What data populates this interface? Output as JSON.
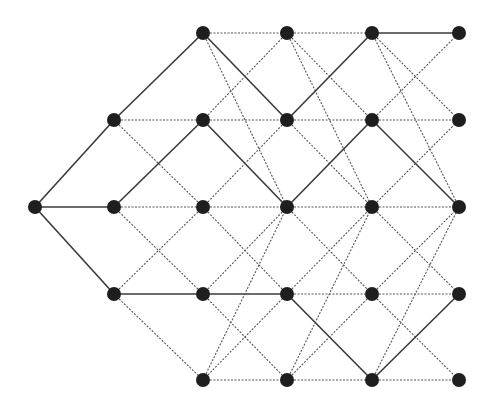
{
  "diagram": {
    "type": "layered-trellis-graph",
    "colors": {
      "background": "#ffffff",
      "node": "#1e1e1e",
      "solid_edge": "#3a3a3a",
      "dashed_edge": "#555555"
    },
    "node_radius": 7,
    "columns_x": [
      35,
      114,
      203,
      287,
      372,
      459
    ],
    "rows_y": [
      33,
      120,
      207,
      294,
      380
    ],
    "nodes": [
      {
        "id": "c0r2",
        "col": 0,
        "row": 2
      },
      {
        "id": "c1r1",
        "col": 1,
        "row": 1
      },
      {
        "id": "c1r2",
        "col": 1,
        "row": 2
      },
      {
        "id": "c1r3",
        "col": 1,
        "row": 3
      },
      {
        "id": "c2r0",
        "col": 2,
        "row": 0
      },
      {
        "id": "c2r1",
        "col": 2,
        "row": 1
      },
      {
        "id": "c2r2",
        "col": 2,
        "row": 2
      },
      {
        "id": "c2r3",
        "col": 2,
        "row": 3
      },
      {
        "id": "c2r4",
        "col": 2,
        "row": 4
      },
      {
        "id": "c3r0",
        "col": 3,
        "row": 0
      },
      {
        "id": "c3r1",
        "col": 3,
        "row": 1
      },
      {
        "id": "c3r2",
        "col": 3,
        "row": 2
      },
      {
        "id": "c3r3",
        "col": 3,
        "row": 3
      },
      {
        "id": "c3r4",
        "col": 3,
        "row": 4
      },
      {
        "id": "c4r0",
        "col": 4,
        "row": 0
      },
      {
        "id": "c4r1",
        "col": 4,
        "row": 1
      },
      {
        "id": "c4r2",
        "col": 4,
        "row": 2
      },
      {
        "id": "c4r3",
        "col": 4,
        "row": 3
      },
      {
        "id": "c4r4",
        "col": 4,
        "row": 4
      },
      {
        "id": "c5r0",
        "col": 5,
        "row": 0
      },
      {
        "id": "c5r1",
        "col": 5,
        "row": 1
      },
      {
        "id": "c5r2",
        "col": 5,
        "row": 2
      },
      {
        "id": "c5r3",
        "col": 5,
        "row": 3
      },
      {
        "id": "c5r4",
        "col": 5,
        "row": 4
      }
    ],
    "edges": [
      {
        "from": "c0r2",
        "to": "c1r1",
        "style": "solid"
      },
      {
        "from": "c0r2",
        "to": "c1r2",
        "style": "solid"
      },
      {
        "from": "c0r2",
        "to": "c1r3",
        "style": "solid"
      },
      {
        "from": "c1r1",
        "to": "c2r0",
        "style": "solid"
      },
      {
        "from": "c1r1",
        "to": "c2r1",
        "style": "dashed"
      },
      {
        "from": "c1r1",
        "to": "c2r2",
        "style": "dashed"
      },
      {
        "from": "c1r2",
        "to": "c2r1",
        "style": "solid"
      },
      {
        "from": "c1r2",
        "to": "c2r2",
        "style": "dashed"
      },
      {
        "from": "c1r2",
        "to": "c2r3",
        "style": "dashed"
      },
      {
        "from": "c1r3",
        "to": "c2r2",
        "style": "dashed"
      },
      {
        "from": "c1r3",
        "to": "c2r3",
        "style": "solid"
      },
      {
        "from": "c1r3",
        "to": "c2r4",
        "style": "dashed"
      },
      {
        "from": "c2r0",
        "to": "c3r0",
        "style": "dashed"
      },
      {
        "from": "c2r0",
        "to": "c3r1",
        "style": "solid"
      },
      {
        "from": "c2r0",
        "to": "c3r2",
        "style": "dashed"
      },
      {
        "from": "c2r1",
        "to": "c3r0",
        "style": "dashed"
      },
      {
        "from": "c2r1",
        "to": "c3r1",
        "style": "dashed"
      },
      {
        "from": "c2r1",
        "to": "c3r2",
        "style": "solid"
      },
      {
        "from": "c2r2",
        "to": "c3r1",
        "style": "dashed"
      },
      {
        "from": "c2r2",
        "to": "c3r2",
        "style": "dashed"
      },
      {
        "from": "c2r2",
        "to": "c3r3",
        "style": "dashed"
      },
      {
        "from": "c2r3",
        "to": "c3r2",
        "style": "dashed"
      },
      {
        "from": "c2r3",
        "to": "c3r3",
        "style": "solid"
      },
      {
        "from": "c2r3",
        "to": "c3r4",
        "style": "dashed"
      },
      {
        "from": "c2r4",
        "to": "c3r2",
        "style": "dashed"
      },
      {
        "from": "c2r4",
        "to": "c3r3",
        "style": "dashed"
      },
      {
        "from": "c2r4",
        "to": "c3r4",
        "style": "dashed"
      },
      {
        "from": "c3r0",
        "to": "c4r0",
        "style": "dashed"
      },
      {
        "from": "c3r0",
        "to": "c4r1",
        "style": "dashed"
      },
      {
        "from": "c3r0",
        "to": "c4r2",
        "style": "dashed"
      },
      {
        "from": "c3r1",
        "to": "c4r0",
        "style": "solid"
      },
      {
        "from": "c3r1",
        "to": "c4r1",
        "style": "dashed"
      },
      {
        "from": "c3r1",
        "to": "c4r2",
        "style": "dashed"
      },
      {
        "from": "c3r2",
        "to": "c4r1",
        "style": "solid"
      },
      {
        "from": "c3r2",
        "to": "c4r2",
        "style": "dashed"
      },
      {
        "from": "c3r2",
        "to": "c4r3",
        "style": "dashed"
      },
      {
        "from": "c3r3",
        "to": "c4r2",
        "style": "dashed"
      },
      {
        "from": "c3r3",
        "to": "c4r3",
        "style": "dashed"
      },
      {
        "from": "c3r3",
        "to": "c4r4",
        "style": "solid"
      },
      {
        "from": "c3r4",
        "to": "c4r2",
        "style": "dashed"
      },
      {
        "from": "c3r4",
        "to": "c4r3",
        "style": "dashed"
      },
      {
        "from": "c3r4",
        "to": "c4r4",
        "style": "dashed"
      },
      {
        "from": "c4r0",
        "to": "c5r0",
        "style": "solid"
      },
      {
        "from": "c4r0",
        "to": "c5r1",
        "style": "dashed"
      },
      {
        "from": "c4r0",
        "to": "c5r2",
        "style": "dashed"
      },
      {
        "from": "c4r1",
        "to": "c5r0",
        "style": "dashed"
      },
      {
        "from": "c4r1",
        "to": "c5r1",
        "style": "dashed"
      },
      {
        "from": "c4r1",
        "to": "c5r2",
        "style": "solid"
      },
      {
        "from": "c4r2",
        "to": "c5r1",
        "style": "dashed"
      },
      {
        "from": "c4r2",
        "to": "c5r2",
        "style": "dashed"
      },
      {
        "from": "c4r2",
        "to": "c5r3",
        "style": "dashed"
      },
      {
        "from": "c4r3",
        "to": "c5r2",
        "style": "dashed"
      },
      {
        "from": "c4r3",
        "to": "c5r3",
        "style": "dashed"
      },
      {
        "from": "c4r3",
        "to": "c5r4",
        "style": "dashed"
      },
      {
        "from": "c4r4",
        "to": "c5r2",
        "style": "dashed"
      },
      {
        "from": "c4r4",
        "to": "c5r3",
        "style": "solid"
      },
      {
        "from": "c4r4",
        "to": "c5r4",
        "style": "dashed"
      }
    ]
  }
}
